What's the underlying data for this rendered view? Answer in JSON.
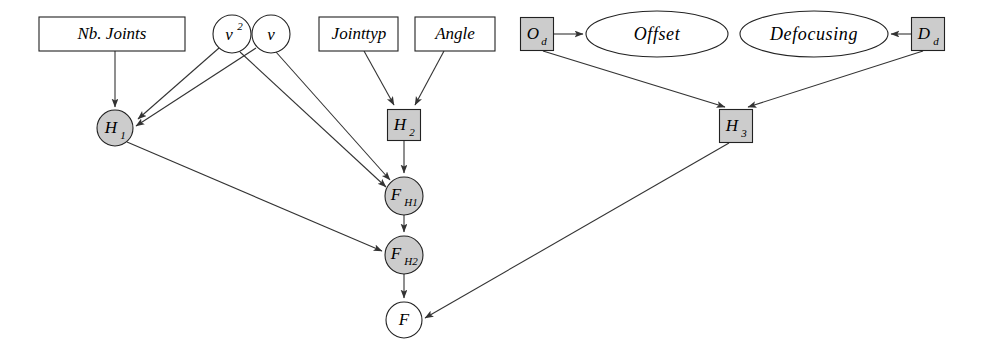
{
  "diagram": {
    "type": "bayesian-network",
    "title": "",
    "colors": {
      "node_fill_gray": "#cccccc",
      "node_fill_white": "#ffffff",
      "stroke": "#222222",
      "edge": "#333333",
      "background": "#ffffff"
    },
    "nodes": [
      {
        "id": "nb_joints",
        "label": "Nb. Joints",
        "shape": "rect",
        "fill": "white",
        "cx": 112,
        "cy": 34,
        "w": 146,
        "h": 34
      },
      {
        "id": "v2",
        "label": "v",
        "sup": "2",
        "shape": "circle",
        "fill": "white",
        "cx": 232,
        "cy": 34,
        "r": 19
      },
      {
        "id": "v",
        "label": "v",
        "shape": "circle",
        "fill": "white",
        "cx": 271,
        "cy": 34,
        "r": 19
      },
      {
        "id": "jointtyp",
        "label": "Jointtyp",
        "shape": "rect",
        "fill": "white",
        "cx": 359,
        "cy": 34,
        "w": 79,
        "h": 34
      },
      {
        "id": "angle",
        "label": "Angle",
        "shape": "rect",
        "fill": "white",
        "cx": 455,
        "cy": 34,
        "w": 80,
        "h": 34
      },
      {
        "id": "od",
        "label": "O",
        "sub": "d",
        "shape": "rect",
        "fill": "gray",
        "cx": 537,
        "cy": 34,
        "w": 33,
        "h": 33
      },
      {
        "id": "offset",
        "label": "Offset",
        "shape": "ellipse",
        "fill": "white",
        "cx": 657,
        "cy": 34,
        "rx": 71,
        "ry": 23
      },
      {
        "id": "defocusing",
        "label": "Defocusing",
        "shape": "ellipse",
        "fill": "white",
        "cx": 814,
        "cy": 34,
        "rx": 74,
        "ry": 23
      },
      {
        "id": "dd",
        "label": "D",
        "sub": "d",
        "shape": "rect",
        "fill": "gray",
        "cx": 928,
        "cy": 34,
        "w": 33,
        "h": 33
      },
      {
        "id": "h1",
        "label": "H",
        "sub": "1",
        "shape": "circle",
        "fill": "gray",
        "cx": 115,
        "cy": 128,
        "r": 18
      },
      {
        "id": "h2",
        "label": "H",
        "sub": "2",
        "shape": "rect",
        "fill": "gray",
        "cx": 404,
        "cy": 125,
        "w": 33,
        "h": 31
      },
      {
        "id": "h3",
        "label": "H",
        "sub": "3",
        "shape": "rect",
        "fill": "gray",
        "cx": 736,
        "cy": 126,
        "w": 33,
        "h": 33
      },
      {
        "id": "fh1",
        "label": "F",
        "sub": "H1",
        "shape": "circle",
        "fill": "gray",
        "cx": 404,
        "cy": 196,
        "r": 19
      },
      {
        "id": "fh2",
        "label": "F",
        "sub": "H2",
        "shape": "circle",
        "fill": "gray",
        "cx": 404,
        "cy": 255,
        "r": 19
      },
      {
        "id": "f",
        "label": "F",
        "shape": "circle",
        "fill": "white",
        "cx": 404,
        "cy": 320,
        "r": 18
      }
    ],
    "edges": [
      {
        "from": "nb_joints",
        "to": "h1"
      },
      {
        "from": "v2",
        "to": "h1"
      },
      {
        "from": "v",
        "to": "h1"
      },
      {
        "from": "v2",
        "to": "fh1"
      },
      {
        "from": "v",
        "to": "fh1"
      },
      {
        "from": "jointtyp",
        "to": "h2"
      },
      {
        "from": "angle",
        "to": "h2"
      },
      {
        "from": "h2",
        "to": "fh1"
      },
      {
        "from": "h1",
        "to": "fh2"
      },
      {
        "from": "fh1",
        "to": "fh2"
      },
      {
        "from": "fh2",
        "to": "f"
      },
      {
        "from": "od",
        "to": "offset"
      },
      {
        "from": "dd",
        "to": "defocusing"
      },
      {
        "from": "od",
        "to": "h3"
      },
      {
        "from": "dd",
        "to": "h3"
      },
      {
        "from": "h3",
        "to": "f"
      }
    ]
  }
}
